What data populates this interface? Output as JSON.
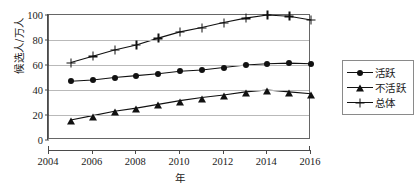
{
  "chart_data": {
    "type": "line",
    "title": "",
    "xlabel": "年",
    "ylabel": "候选人/万人",
    "x": [
      2005,
      2006,
      2007,
      2008,
      2009,
      2010,
      2011,
      2012,
      2013,
      2014,
      2015,
      2016
    ],
    "xlim": [
      2004,
      2016
    ],
    "ylim": [
      0,
      100
    ],
    "xticks": [
      "2004",
      "2006",
      "2008",
      "2010",
      "2012",
      "2014",
      "2016"
    ],
    "yticks": [
      "0",
      "20",
      "40",
      "60",
      "80",
      "100"
    ],
    "grid": "horizontal",
    "legend_position": "right",
    "series": [
      {
        "name": "活跃",
        "marker": "circle",
        "values": [
          47,
          48,
          50,
          51.5,
          53,
          55,
          56,
          58,
          60,
          61,
          61.5,
          61
        ]
      },
      {
        "name": "不活跃",
        "marker": "triangle",
        "values": [
          16,
          19.5,
          23,
          25.5,
          28.5,
          31.5,
          34,
          36,
          38.5,
          40,
          38.5,
          37
        ]
      },
      {
        "name": "总体",
        "marker": "plus",
        "values": [
          62,
          67,
          72,
          76,
          81.5,
          86.5,
          90,
          94,
          97.5,
          100,
          99,
          96
        ]
      }
    ]
  },
  "axes": {
    "y_title": "候选人/万人",
    "x_title": "年"
  },
  "legend": {
    "items": [
      {
        "label": "活跃",
        "marker": "circle-marker"
      },
      {
        "label": "不活跃",
        "marker": "triangle-marker"
      },
      {
        "label": "总体",
        "marker": "plus-marker"
      }
    ]
  }
}
